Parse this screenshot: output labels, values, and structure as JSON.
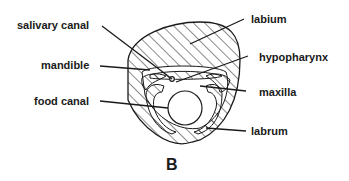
{
  "figure": {
    "panel_label": "B",
    "labels": {
      "salivary_canal": "salivary canal",
      "mandible": "mandible",
      "food_canal": "food canal",
      "labium": "labium",
      "hypopharynx": "hypopharynx",
      "maxilla": "maxilla",
      "labrum": "labrum"
    },
    "colors": {
      "ink": "#1a1a1a",
      "background": "#ffffff"
    }
  }
}
